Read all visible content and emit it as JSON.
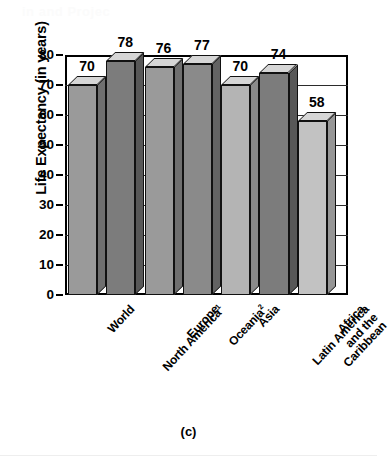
{
  "figure": {
    "caption": "(c)",
    "ghost_text": "in and Projec"
  },
  "chart_data": {
    "type": "bar",
    "title": "",
    "subtitle": "",
    "xlabel": "",
    "ylabel": "Life Expectancy (in years)",
    "ylim": [
      0,
      80
    ],
    "ytick_step": 10,
    "yticks": [
      80,
      70,
      60,
      50,
      40,
      30,
      20,
      10,
      0
    ],
    "grid": true,
    "grid_axis": "y",
    "legend": false,
    "legend_position": "none",
    "three_d": true,
    "categories": [
      "World",
      "North America¹",
      "Europe",
      "Oceania²",
      "Asia",
      "Latin America and the Caribbean",
      "Africa"
    ],
    "category_lines": [
      [
        "World"
      ],
      [
        "North America¹"
      ],
      [
        "Europe"
      ],
      [
        "Oceania²"
      ],
      [
        "Asia"
      ],
      [
        "Latin America",
        "and the",
        "Caribbean"
      ],
      [
        "Africa"
      ]
    ],
    "values": [
      70,
      78,
      76,
      77,
      70,
      74,
      58
    ],
    "data_labels": [
      "70",
      "78",
      "76",
      "77",
      "70",
      "74",
      "58"
    ],
    "bar_colors": [
      "#9a9a9a",
      "#7c7c7c",
      "#9a9a9a",
      "#8a8a8a",
      "#b4b4b4",
      "#7c7c7c",
      "#c2c2c2"
    ],
    "bar_side_colors": [
      "#6f6f6f",
      "#585858",
      "#6f6f6f",
      "#636363",
      "#8a8a8a",
      "#585858",
      "#969696"
    ],
    "bar_top_color": "#d6d6d6",
    "outline_color": "#111111",
    "footnotes": [
      "1",
      "2"
    ]
  }
}
